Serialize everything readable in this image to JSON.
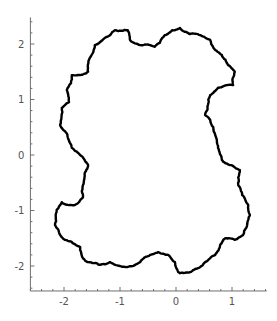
{
  "chart_data": {
    "type": "line",
    "title": "",
    "xlabel": "",
    "ylabel": "",
    "xlim": [
      -2.6,
      1.62
    ],
    "ylim": [
      -2.45,
      2.48
    ],
    "grid": false,
    "legend": null,
    "x_ticks": [
      -2,
      -1,
      0,
      1
    ],
    "x_tick_labels": [
      "-2",
      "-1",
      "0",
      "1"
    ],
    "y_ticks": [
      -2,
      -1,
      0,
      1,
      2
    ],
    "y_tick_labels": [
      "-2",
      "-1",
      "0",
      "1",
      "2"
    ],
    "series": [
      {
        "name": "closed fractal curve",
        "color": "#000000",
        "closed": true,
        "points": [
          [
            -2.07,
            0.54
          ],
          [
            -2.04,
            0.85
          ],
          [
            -1.91,
            0.95
          ],
          [
            -1.95,
            1.17
          ],
          [
            -1.86,
            1.44
          ],
          [
            -1.71,
            1.44
          ],
          [
            -1.57,
            1.5
          ],
          [
            -1.54,
            1.75
          ],
          [
            -1.45,
            1.98
          ],
          [
            -1.27,
            2.11
          ],
          [
            -1.09,
            2.25
          ],
          [
            -0.86,
            2.25
          ],
          [
            -0.82,
            2.07
          ],
          [
            -0.64,
            1.98
          ],
          [
            -0.46,
            1.98
          ],
          [
            -0.38,
            1.95
          ],
          [
            -0.29,
            2.02
          ],
          [
            -0.2,
            2.16
          ],
          [
            -0.07,
            2.25
          ],
          [
            0.07,
            2.29
          ],
          [
            0.25,
            2.18
          ],
          [
            0.43,
            2.16
          ],
          [
            0.61,
            2.07
          ],
          [
            0.7,
            1.89
          ],
          [
            0.82,
            1.8
          ],
          [
            0.93,
            1.62
          ],
          [
            1.05,
            1.5
          ],
          [
            1.02,
            1.26
          ],
          [
            0.91,
            1.26
          ],
          [
            0.75,
            1.21
          ],
          [
            0.61,
            1.08
          ],
          [
            0.57,
            0.9
          ],
          [
            0.52,
            0.72
          ],
          [
            0.61,
            0.63
          ],
          [
            0.7,
            0.36
          ],
          [
            0.75,
            0.13
          ],
          [
            0.82,
            -0.09
          ],
          [
            0.96,
            -0.18
          ],
          [
            1.14,
            -0.27
          ],
          [
            1.11,
            -0.54
          ],
          [
            1.18,
            -0.72
          ],
          [
            1.29,
            -0.9
          ],
          [
            1.32,
            -1.08
          ],
          [
            1.29,
            -1.17
          ],
          [
            1.2,
            -1.44
          ],
          [
            1.05,
            -1.53
          ],
          [
            0.88,
            -1.5
          ],
          [
            0.79,
            -1.62
          ],
          [
            0.7,
            -1.8
          ],
          [
            0.52,
            -1.93
          ],
          [
            0.39,
            -2.04
          ],
          [
            0.25,
            -2.11
          ],
          [
            0.07,
            -2.13
          ],
          [
            0.04,
            -2.11
          ],
          [
            -0.02,
            -1.93
          ],
          [
            -0.14,
            -1.8
          ],
          [
            -0.32,
            -1.75
          ],
          [
            -0.46,
            -1.8
          ],
          [
            -0.64,
            -1.93
          ],
          [
            -0.73,
            -1.98
          ],
          [
            -1.0,
            -2.0
          ],
          [
            -1.18,
            -1.93
          ],
          [
            -1.36,
            -1.98
          ],
          [
            -1.57,
            -1.93
          ],
          [
            -1.66,
            -1.86
          ],
          [
            -1.71,
            -1.66
          ],
          [
            -1.86,
            -1.57
          ],
          [
            -1.98,
            -1.53
          ],
          [
            -2.07,
            -1.44
          ],
          [
            -2.16,
            -1.26
          ],
          [
            -2.13,
            -0.99
          ],
          [
            -2.04,
            -0.85
          ],
          [
            -1.93,
            -0.9
          ],
          [
            -1.8,
            -0.9
          ],
          [
            -1.66,
            -0.76
          ],
          [
            -1.66,
            -0.54
          ],
          [
            -1.63,
            -0.36
          ],
          [
            -1.57,
            -0.18
          ],
          [
            -1.63,
            -0.09
          ],
          [
            -1.75,
            0.04
          ],
          [
            -1.86,
            0.13
          ],
          [
            -1.93,
            0.31
          ],
          [
            -2.04,
            0.49
          ]
        ]
      }
    ]
  }
}
